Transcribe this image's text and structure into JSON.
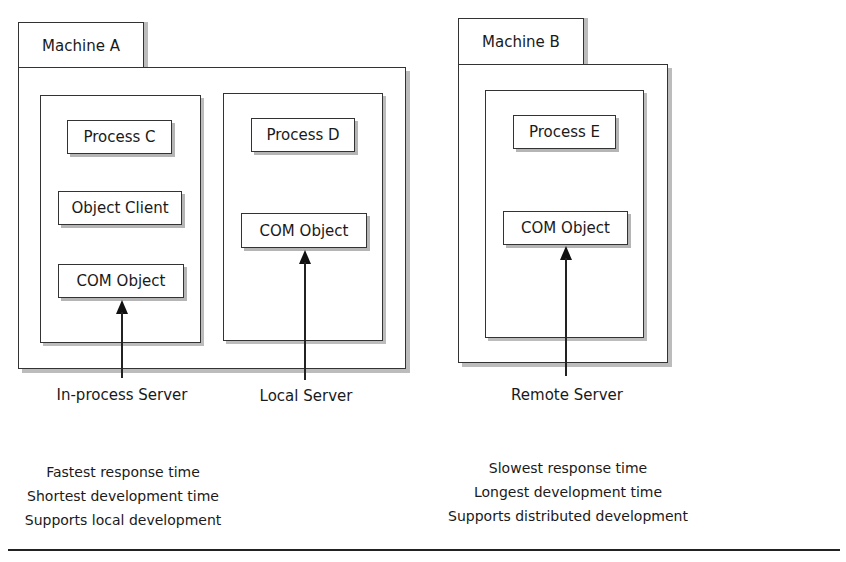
{
  "machines": [
    {
      "name": "Machine A",
      "processes": [
        {
          "boxes": [
            "Process C",
            "Object Client",
            "COM Object"
          ]
        },
        {
          "boxes": [
            "Process D",
            "COM Object"
          ]
        }
      ]
    },
    {
      "name": "Machine B",
      "processes": [
        {
          "boxes": [
            "Process E",
            "COM Object"
          ]
        }
      ]
    }
  ],
  "servers": [
    {
      "label": "In-process Server"
    },
    {
      "label": "Local Server"
    },
    {
      "label": "Remote Server"
    }
  ],
  "notes": {
    "left": [
      "Fastest response time",
      "Shortest development time",
      "Supports local development"
    ],
    "right": [
      "Slowest response time",
      "Longest development time",
      "Supports distributed development"
    ]
  }
}
